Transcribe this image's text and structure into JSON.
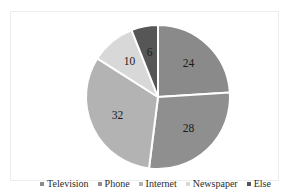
{
  "chart_data": {
    "type": "pie",
    "title": "",
    "categories": [
      "Television",
      "Phone",
      "Internet",
      "Newspaper",
      "Else"
    ],
    "values": [
      24,
      28,
      32,
      10,
      6
    ],
    "labels": [
      "24",
      "28",
      "32",
      "10",
      "6"
    ],
    "total": 100,
    "colors": [
      "#8a8a8a",
      "#8f8f8f",
      "#b3b3b3",
      "#d8d8d8",
      "#565656"
    ],
    "start_angle_deg": 0,
    "direction": "clockwise",
    "slice_border_color": "#ffffff",
    "slice_border_width": 2,
    "legend_position": "bottom",
    "grid": false,
    "xlabel": "",
    "ylabel": ""
  },
  "legend": {
    "items": [
      {
        "label": "Television",
        "color": "#8a8a8a"
      },
      {
        "label": "Phone",
        "color": "#8f8f8f"
      },
      {
        "label": "Internet",
        "color": "#b3b3b3"
      },
      {
        "label": "Newspaper",
        "color": "#d8d8d8"
      },
      {
        "label": "Else",
        "color": "#565656"
      }
    ]
  },
  "frame": {
    "border_color": "#ededed",
    "background": "#ffffff"
  }
}
